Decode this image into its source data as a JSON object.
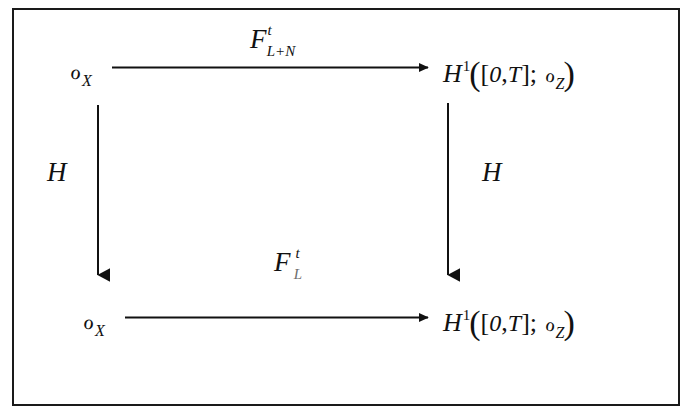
{
  "figure": {
    "kind": "commutative-diagram",
    "frame_color": "#1a1a1a",
    "ink_color": "#111111",
    "background": "#ffffff"
  },
  "nodes": {
    "top_left": {
      "name": "O_X",
      "script_o": "ℴ",
      "subscript": "X"
    },
    "top_right": {
      "name": "H^1([0,T]; O_Z)",
      "head": "H",
      "superscript": "1",
      "open_paren": "(",
      "open_bracket": "[",
      "zero": "0",
      "comma": ",",
      "T": "T",
      "close_bracket": "]",
      "semicolon": ";",
      "script_o": "ℴ",
      "subscript": "Z",
      "close_paren": ")"
    },
    "bottom_left": {
      "name": "O_X",
      "script_o": "ℴ",
      "subscript": "X"
    },
    "bottom_right": {
      "name": "H^1([0,T]; O_Z)",
      "head": "H",
      "superscript": "1",
      "open_paren": "(",
      "open_bracket": "[",
      "zero": "0",
      "comma": ",",
      "T": "T",
      "close_bracket": "]",
      "semicolon": ";",
      "script_o": "ℴ",
      "subscript": "Z",
      "close_paren": ")"
    }
  },
  "arrows": {
    "top": {
      "direction": "right",
      "label_base": "F",
      "label_superscript": "t",
      "label_subscript": "L+N"
    },
    "bottom": {
      "direction": "right",
      "label_base": "F",
      "label_superscript": "t",
      "label_subscript": "L"
    },
    "left": {
      "direction": "down",
      "label": "H"
    },
    "right": {
      "direction": "down",
      "label": "H"
    }
  }
}
